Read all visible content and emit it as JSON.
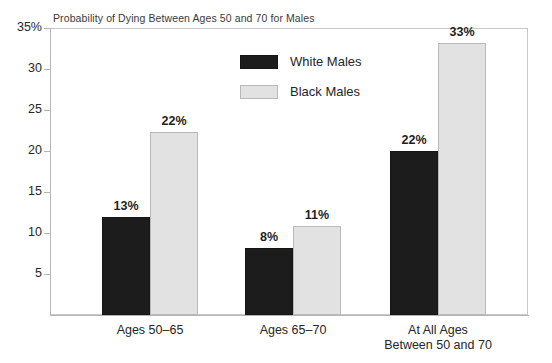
{
  "chart_data": {
    "type": "bar",
    "title": "Probability of Dying Between Ages 50 and 70 for Males",
    "xlabel": "",
    "ylabel": "",
    "ylim": [
      0,
      35
    ],
    "grid": false,
    "legend_position": "inside-top-center",
    "y_ticks": [
      {
        "value": 35,
        "label": "35%"
      },
      {
        "value": 30,
        "label": "30"
      },
      {
        "value": 25,
        "label": "25"
      },
      {
        "value": 20,
        "label": "20"
      },
      {
        "value": 15,
        "label": "15"
      },
      {
        "value": 10,
        "label": "10"
      },
      {
        "value": 5,
        "label": "5"
      }
    ],
    "categories": [
      "Ages 50–65",
      "Ages 65–70",
      "At All Ages Between 50 and 70"
    ],
    "category_lines": [
      [
        "Ages 50–65"
      ],
      [
        "Ages 65–70"
      ],
      [
        "At All Ages",
        "Between 50 and 70"
      ]
    ],
    "series": [
      {
        "name": "White Males",
        "color": "#1c1c1c",
        "values": [
          13,
          8,
          22
        ],
        "plotted": [
          12.0,
          8.2,
          20.0
        ],
        "labels": [
          "13%",
          "8%",
          "22%"
        ]
      },
      {
        "name": "Black Males",
        "color": "#e2e2e2",
        "values": [
          22,
          11,
          33
        ],
        "plotted": [
          22.3,
          10.8,
          33.2
        ],
        "labels": [
          "22%",
          "11%",
          "33%"
        ]
      }
    ]
  },
  "legend": {
    "items": [
      {
        "label": "White Males",
        "swatch": "white-males-swatch"
      },
      {
        "label": "Black Males",
        "swatch": "black-males-swatch"
      }
    ]
  }
}
